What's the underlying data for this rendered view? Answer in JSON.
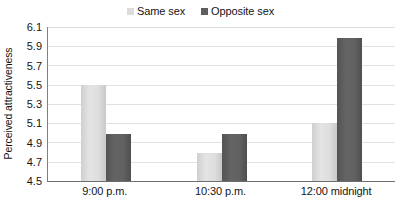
{
  "chart_data": {
    "type": "bar",
    "title": "",
    "xlabel": "",
    "ylabel": "Perceived attractiveness",
    "categories": [
      "9:00 p.m.",
      "10:30 p.m.",
      "12:00 midnight"
    ],
    "series": [
      {
        "name": "Same sex",
        "color": "#dcdcdc",
        "values": [
          5.5,
          4.79,
          5.1
        ]
      },
      {
        "name": "Opposite sex",
        "color": "#5e5e5e",
        "values": [
          4.99,
          4.99,
          5.99
        ]
      }
    ],
    "ylim": [
      4.5,
      6.1
    ],
    "ytick_step": 0.2,
    "yticks": [
      "6.1",
      "5.9",
      "5.7",
      "5.5",
      "5.3",
      "5.1",
      "4.9",
      "4.7",
      "4.5"
    ],
    "grid": "horizontal",
    "legend_position": "top-center"
  }
}
